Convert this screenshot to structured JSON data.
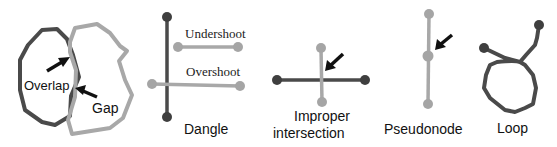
{
  "colors": {
    "dark_line": "#4a4a4a",
    "dark_node": "#3f3f3f",
    "light_line": "#a8a8a8",
    "light_node": "#a5a5a5",
    "arrow": "#111111",
    "label": "#111111"
  },
  "panels": [
    {
      "id": "overlap-gap",
      "labels": {
        "overlap": "Overlap",
        "gap": "Gap"
      }
    },
    {
      "id": "dangle",
      "title": "Dangle",
      "labels": {
        "undershoot": "Undershoot",
        "overshoot": "Overshoot"
      }
    },
    {
      "id": "improper-intersection",
      "title_line1": "Improper",
      "title_line2": "intersection"
    },
    {
      "id": "pseudonode",
      "title": "Pseudonode"
    },
    {
      "id": "loop",
      "title": "Loop"
    }
  ]
}
